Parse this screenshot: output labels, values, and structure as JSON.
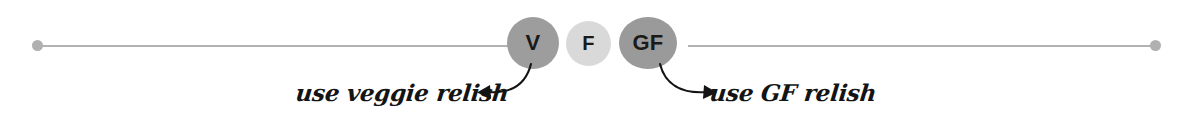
{
  "divider": {
    "line_color": "#b2b2b2",
    "endpoint_dot_color": "#b0b0b0",
    "left_dot_name": "left-endpoint-dot",
    "right_dot_name": "right-endpoint-dot"
  },
  "badges": [
    {
      "id": "v",
      "label": "V",
      "color": "#9d9d9d",
      "meaning": "vegetarian"
    },
    {
      "id": "f",
      "label": "F",
      "color": "#d9d9d9",
      "meaning": "freezer"
    },
    {
      "id": "gf",
      "label": "GF",
      "color": "#9a9a9a",
      "meaning": "gluten free"
    }
  ],
  "annotations": {
    "left": {
      "text": "use veggie relish",
      "arrow_direction": "left"
    },
    "right": {
      "text": "use GF relish",
      "arrow_direction": "right"
    }
  }
}
